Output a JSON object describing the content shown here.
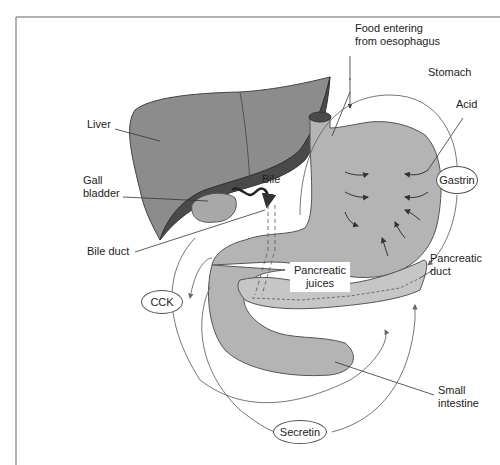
{
  "diagram": {
    "type": "anatomical-diagram",
    "colors": {
      "liver_light": "#8c8c8c",
      "liver_dark": "#4a4a4a",
      "organ_fill": "#b4b4b4",
      "pancreas_fill": "#c6c6c6",
      "outline": "#555555",
      "text": "#222222"
    },
    "labels": {
      "food": [
        "Food entering",
        "from oesophagus"
      ],
      "stomach": "Stomach",
      "acid": "Acid",
      "liver": "Liver",
      "gall_bladder": [
        "Gall",
        "bladder"
      ],
      "bile": "Bile",
      "bile_duct": "Bile duct",
      "pancreatic_juices": [
        "Pancreatic",
        "juices"
      ],
      "pancreatic_duct": [
        "Pancreatic",
        "duct"
      ],
      "small_intestine": [
        "Small",
        "intestine"
      ]
    },
    "hormones": {
      "gastrin": "Gastrin",
      "cck": "CCK",
      "secretin": "Secretin"
    }
  }
}
